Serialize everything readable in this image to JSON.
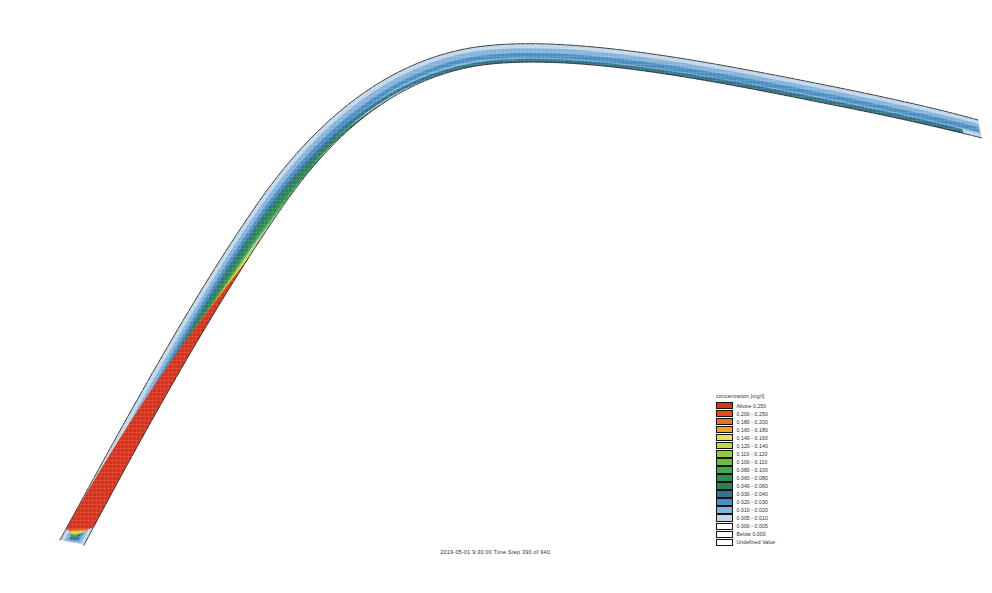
{
  "figure": {
    "background_color": "#ffffff",
    "width": 992,
    "height": 593
  },
  "legend": {
    "title": "concentration [mg/l]",
    "entries": [
      {
        "label": "Above  0.250",
        "color": "#d6331d"
      },
      {
        "label": "0.200 - 0.250",
        "color": "#e34a1e"
      },
      {
        "label": "0.180 - 0.200",
        "color": "#e8731f"
      },
      {
        "label": "0.160 - 0.180",
        "color": "#eda526"
      },
      {
        "label": "0.140 - 0.160",
        "color": "#e8e05c"
      },
      {
        "label": "0.120 - 0.140",
        "color": "#c6d94b"
      },
      {
        "label": "0.110 - 0.120",
        "color": "#97c93f"
      },
      {
        "label": "0.100 - 0.110",
        "color": "#6fbb44"
      },
      {
        "label": "0.080 - 0.100",
        "color": "#46a84c"
      },
      {
        "label": "0.060 - 0.080",
        "color": "#2d8f4e"
      },
      {
        "label": "0.040 - 0.060",
        "color": "#2f7f55"
      },
      {
        "label": "0.030 - 0.040",
        "color": "#33738b"
      },
      {
        "label": "0.020 - 0.030",
        "color": "#4a8fc4"
      },
      {
        "label": "0.010 - 0.020",
        "color": "#86b3d9"
      },
      {
        "label": "0.005 - 0.010",
        "color": "#c2d8ea"
      },
      {
        "label": "0.000 - 0.005",
        "color": "#ffffff"
      },
      {
        "label": "Below  0.000",
        "color": "#ffffff"
      },
      {
        "label": "Undefined Value",
        "color": "#ffffff"
      }
    ]
  },
  "caption": {
    "text": "2019-05-01 9:30:00  Time Step 390 of 940."
  },
  "chart_data": {
    "type": "heatmap",
    "title": "concentration [mg/l]",
    "subtitle": "2019-05-01 9:30:00  Time Step 390 of 940.",
    "xlabel": "",
    "ylabel": "",
    "grid": false,
    "legend_position": "center-right",
    "colorbar": {
      "units": "mg/l",
      "class_breaks": [
        0.0,
        0.005,
        0.01,
        0.02,
        0.03,
        0.04,
        0.06,
        0.08,
        0.1,
        0.11,
        0.12,
        0.14,
        0.16,
        0.18,
        0.2,
        0.25
      ],
      "below_label": "Below  0.000",
      "above_label": "Above  0.250",
      "undefined_label": "Undefined Value",
      "colors": [
        "#ffffff",
        "#c2d8ea",
        "#86b3d9",
        "#4a8fc4",
        "#33738b",
        "#2f7f55",
        "#2d8f4e",
        "#46a84c",
        "#6fbb44",
        "#97c93f",
        "#c6d94b",
        "#e8e05c",
        "#eda526",
        "#e8731f",
        "#e34a1e",
        "#d6331d"
      ]
    },
    "plume_profile": {
      "description": "Peak concentration along the plume centreline as a fraction of distance along the channel reach, reading from the lower-left (upstream source end) to the right (downstream end).",
      "x": [
        0.0,
        0.08,
        0.16,
        0.24,
        0.32,
        0.4,
        0.48,
        0.56,
        0.64,
        0.72,
        0.8,
        0.88,
        0.94,
        1.0
      ],
      "peak_concentration": [
        0.005,
        0.03,
        0.1,
        0.2,
        0.26,
        0.27,
        0.265,
        0.25,
        0.2,
        0.14,
        0.09,
        0.05,
        0.025,
        0.008
      ]
    }
  }
}
